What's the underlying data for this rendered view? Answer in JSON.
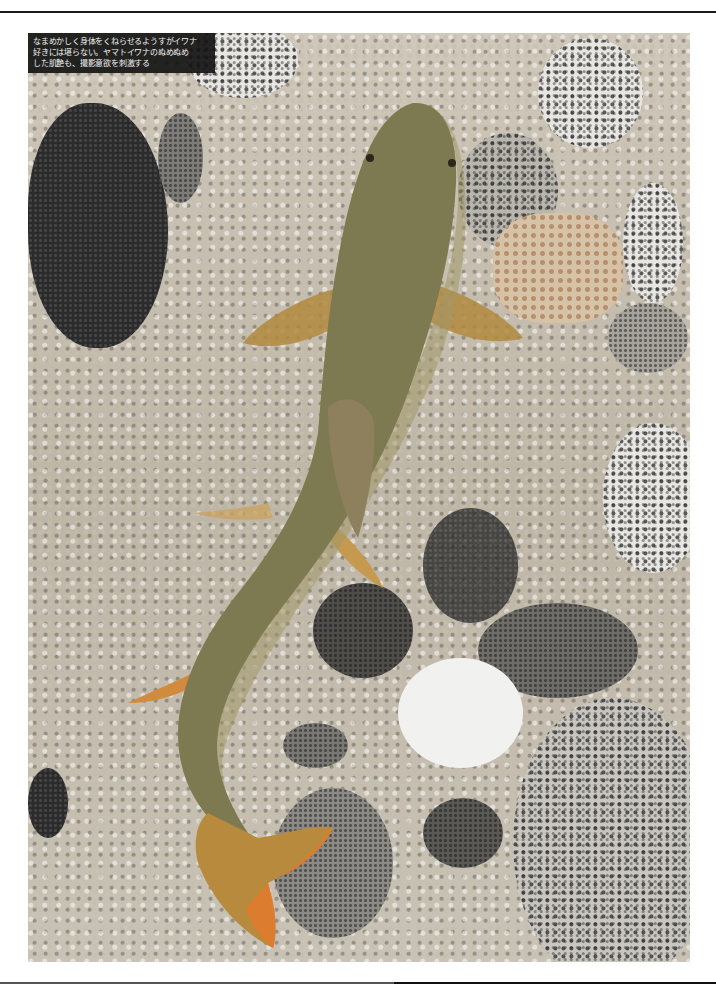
{
  "page": {
    "caption_lines": [
      "なまめかしく身体をくねらせるようすがイワナ",
      "好きには堪らない。ヤマトイワナのぬめぬめ",
      "した肌艶も、撮影意欲を刺激する"
    ]
  },
  "photo": {
    "subject": "Yamato iwana (char) fish lying on pebbles and granite stones",
    "colors": {
      "fish_body": "#7e7a52",
      "fish_belly": "#a79e6b",
      "fins": "#c89a4a",
      "tail_tip": "#e0782e",
      "gravel": "#c6bfb1"
    }
  }
}
